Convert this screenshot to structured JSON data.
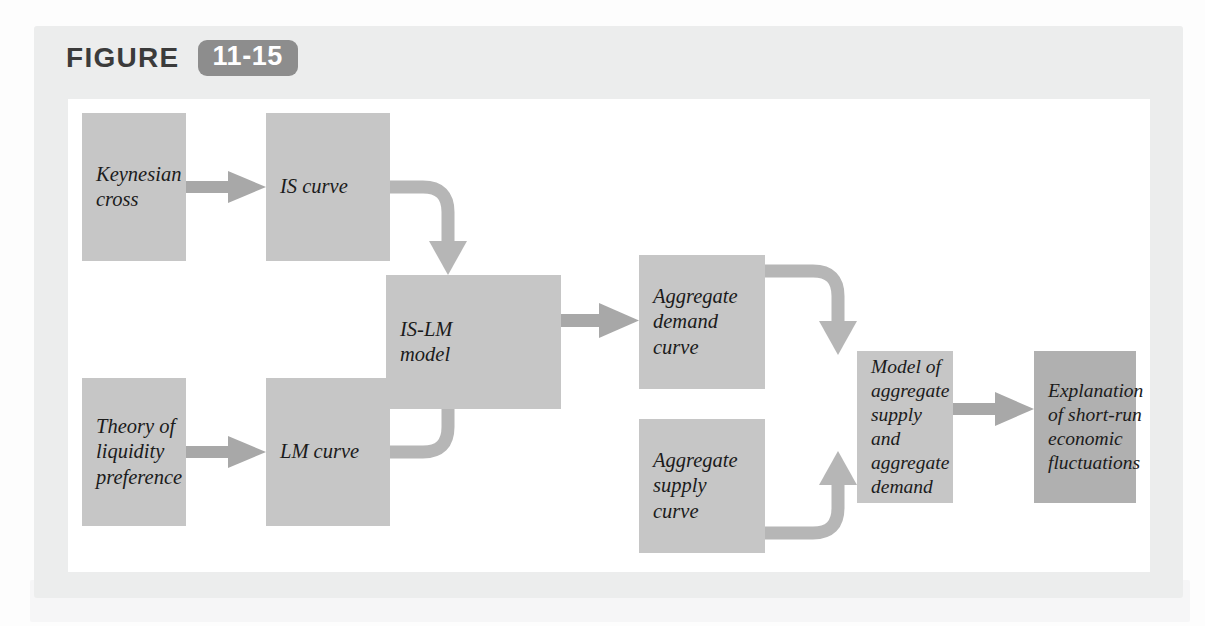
{
  "figure": {
    "word": "FIGURE",
    "number": "11-15",
    "badge_color": "#8d8d8d",
    "panel_color": "#eceded",
    "canvas_color": "#ffffff"
  },
  "diagram": {
    "type": "flowchart",
    "node_color": "#c6c6c6",
    "terminal_node_color": "#b0b0b0",
    "connector_color": "#b6b6b6",
    "arrow_color": "#a8a8a8",
    "nodes": [
      {
        "id": "keynesian-cross",
        "label": "Keynesian\ncross"
      },
      {
        "id": "is-curve",
        "label": "IS curve"
      },
      {
        "id": "theory-liquidity",
        "label": "Theory of\nliquidity\npreference"
      },
      {
        "id": "lm-curve",
        "label": "LM curve"
      },
      {
        "id": "is-lm-model",
        "label": "IS-LM\nmodel"
      },
      {
        "id": "ad-curve",
        "label": "Aggregate\ndemand\ncurve"
      },
      {
        "id": "as-curve",
        "label": "Aggregate\nsupply\ncurve"
      },
      {
        "id": "as-ad-model",
        "label": "Model of\naggregate\nsupply and\naggregate\ndemand"
      },
      {
        "id": "explanation",
        "label": "Explanation\nof short-run\neconomic\nfluctuations"
      }
    ],
    "edges": [
      {
        "from": "keynesian-cross",
        "to": "is-curve",
        "style": "straight"
      },
      {
        "from": "theory-liquidity",
        "to": "lm-curve",
        "style": "straight"
      },
      {
        "from": "is-curve",
        "to": "is-lm-model",
        "style": "elbow-down"
      },
      {
        "from": "lm-curve",
        "to": "is-lm-model",
        "style": "elbow-up"
      },
      {
        "from": "is-lm-model",
        "to": "ad-curve",
        "style": "straight"
      },
      {
        "from": "ad-curve",
        "to": "as-ad-model",
        "style": "elbow-down"
      },
      {
        "from": "as-curve",
        "to": "as-ad-model",
        "style": "elbow-up"
      },
      {
        "from": "as-ad-model",
        "to": "explanation",
        "style": "straight"
      }
    ]
  }
}
